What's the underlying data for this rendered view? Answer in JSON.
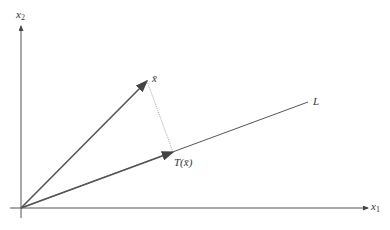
{
  "diagram": {
    "labels": {
      "x2_axis": "x",
      "x2_sub": "2",
      "x1_axis": "x",
      "x1_sub": "1",
      "vector_x": "x̄",
      "projection": "T(x̄)",
      "line": "L"
    },
    "colors": {
      "axis": "#555555",
      "vector": "#555555",
      "projection_line": "#999999"
    }
  }
}
